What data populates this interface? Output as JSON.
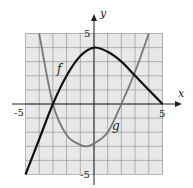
{
  "chart_data": {
    "type": "line",
    "title": "",
    "xlabel": "x",
    "ylabel": "y",
    "xlim": [
      -5,
      5
    ],
    "ylim": [
      -5,
      5
    ],
    "grid": true,
    "tick_labels": {
      "x": [
        "-5",
        "5"
      ],
      "y": [
        "5",
        "-5"
      ]
    },
    "series": [
      {
        "name": "f",
        "x": [
          -5,
          -4,
          -3,
          -2,
          -1,
          0,
          1,
          2,
          3,
          4,
          5
        ],
        "values": [
          -5,
          -2.5,
          0,
          2,
          3.4,
          4,
          3.7,
          3,
          2,
          1,
          0
        ]
      },
      {
        "name": "g",
        "x": [
          -4,
          -3,
          -2,
          -1,
          -0.5,
          0,
          1,
          2,
          3,
          4
        ],
        "values": [
          5,
          0,
          -2.2,
          -2.9,
          -3,
          -2.8,
          -2,
          0,
          2.3,
          5
        ]
      }
    ]
  },
  "labels": {
    "f": "f",
    "g": "g",
    "x": "x",
    "y": "y",
    "xmin": "-5",
    "xmax": "5",
    "ymax": "5",
    "ymin": "-5"
  }
}
